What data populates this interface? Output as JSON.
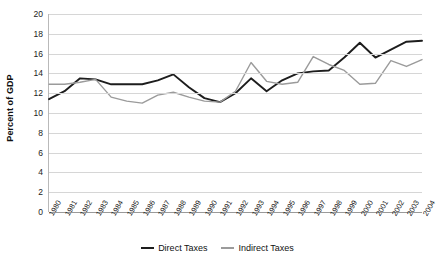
{
  "chart_data": {
    "type": "line",
    "title": "",
    "xlabel": "",
    "ylabel": "Percent of GDP",
    "ylim": [
      0,
      20
    ],
    "ytick_step": 2,
    "yticks": [
      0,
      2,
      4,
      6,
      8,
      10,
      12,
      14,
      16,
      18,
      20
    ],
    "grid": true,
    "legend_position": "bottom",
    "x": [
      "1980",
      "1981",
      "1982",
      "1983",
      "1984",
      "1985",
      "1986",
      "1987",
      "1988",
      "1989",
      "1990",
      "1991",
      "1992",
      "1993",
      "1994",
      "1995",
      "1996",
      "1997",
      "1998",
      "1999",
      "2000",
      "2001",
      "2002",
      "2003",
      "2004"
    ],
    "series": [
      {
        "name": "Direct Taxes",
        "color": "#1d1d1d",
        "width": 1.9,
        "values": [
          11.4,
          12.2,
          13.5,
          13.4,
          12.9,
          12.9,
          12.9,
          13.3,
          13.9,
          12.6,
          11.5,
          11.1,
          12.0,
          13.5,
          12.2,
          13.3,
          14.0,
          14.2,
          14.3,
          15.6,
          17.1,
          15.6,
          16.4,
          17.2,
          17.3
        ]
      },
      {
        "name": "Indirect Taxes",
        "color": "#9b9b9b",
        "width": 1.4,
        "values": [
          12.9,
          12.9,
          13.1,
          13.4,
          11.6,
          11.2,
          11.0,
          11.8,
          12.1,
          11.6,
          11.2,
          11.1,
          12.2,
          15.1,
          13.2,
          12.9,
          13.1,
          15.7,
          14.9,
          14.3,
          12.9,
          13.0,
          15.3,
          14.7,
          15.4
        ]
      }
    ]
  },
  "legend": {
    "items": [
      {
        "label": "Direct Taxes",
        "color": "#1d1d1d"
      },
      {
        "label": "Indirect Taxes",
        "color": "#9b9b9b"
      }
    ]
  }
}
